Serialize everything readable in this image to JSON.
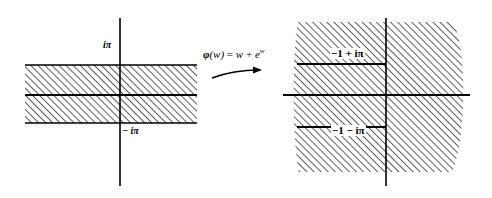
{
  "figure": {
    "type": "complex-mapping-diagram",
    "left_panel": {
      "name": "w-plane-strip",
      "region_label": "horizontal strip",
      "axis_labels": {
        "upper_boundary": "iπ",
        "lower_boundary": "− iπ"
      },
      "geometry": {
        "strip_left": 25,
        "strip_right": 197,
        "top_boundary_y": 65,
        "middle_axis_y": 95,
        "bottom_boundary_y": 123,
        "vertical_axis_x": 120,
        "vertical_axis_top": 18,
        "vertical_axis_bottom": 186
      }
    },
    "map_arrow": {
      "name": "mapping-arrow",
      "formula_fn": "φ",
      "formula_arg": "(w)",
      "formula_eq": " = ",
      "formula_w": "w",
      "formula_plus": " + ",
      "formula_e": "e",
      "formula_exp": "w"
    },
    "right_panel": {
      "name": "image-plane-region",
      "region_label": "slit image region",
      "axis_labels": {
        "upper_slit": "−1  +  iπ",
        "lower_slit": "−1  − iπ"
      },
      "geometry": {
        "upper_slit_y": 64,
        "middle_axis_y": 95,
        "lower_slit_y": 127,
        "slit_left": 297,
        "slit_right": 386,
        "vertical_axis_x": 386,
        "vertical_axis_top": 18,
        "vertical_axis_bottom": 186,
        "horizontal_axis_left": 283,
        "horizontal_axis_right": 470
      }
    },
    "style": {
      "hatch_color": "#1a1a1a",
      "line_color": "#000000",
      "background": "#ffffff"
    }
  }
}
